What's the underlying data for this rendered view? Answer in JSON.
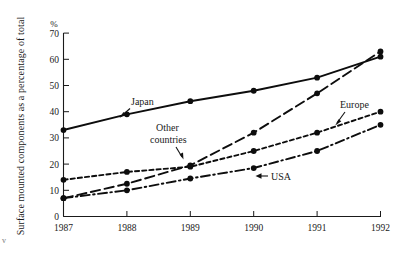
{
  "chart_data": {
    "type": "line",
    "title": "",
    "subtitle": "",
    "xlabel": "",
    "ylabel": "Surface mounted components as a percentage of total",
    "unit_label": "%",
    "categories": [
      "1987",
      "1988",
      "1989",
      "1990",
      "1991",
      "1992"
    ],
    "x": [
      1987,
      1988,
      1989,
      1990,
      1991,
      1992
    ],
    "xlim": [
      1987,
      1992
    ],
    "ylim": [
      0,
      70
    ],
    "yticks": [
      0,
      10,
      20,
      30,
      40,
      50,
      60,
      70
    ],
    "ytick_labels": [
      "0",
      "10",
      "20",
      "30",
      "40",
      "50",
      "60",
      "70"
    ],
    "xtick_labels": [
      "1987",
      "1988",
      "1989",
      "1990",
      "1991",
      "1992"
    ],
    "grid": false,
    "legend": "inline-annotations",
    "series": [
      {
        "name": "Japan",
        "style": "solid",
        "color": "#0d0d0d",
        "values": [
          33,
          39,
          44,
          48,
          53,
          61
        ]
      },
      {
        "name": "Other countries",
        "style": "long-dash",
        "color": "#0d0d0d",
        "values": [
          7,
          12.5,
          19.5,
          32,
          47,
          63
        ]
      },
      {
        "name": "Europe",
        "style": "short-dash",
        "color": "#0d0d0d",
        "values": [
          14,
          17,
          19,
          25,
          32,
          40
        ]
      },
      {
        "name": "USA",
        "style": "dash-dot",
        "color": "#0d0d0d",
        "values": [
          7,
          10,
          14.5,
          18.5,
          25,
          35
        ]
      }
    ],
    "annotations": [
      {
        "text": "Japan",
        "series": "Japan"
      },
      {
        "text_line1": "Other",
        "text_line2": "countries",
        "series": "Other countries"
      },
      {
        "text": "Europe",
        "series": "Europe"
      },
      {
        "text": "USA",
        "series": "USA"
      }
    ]
  },
  "annotations": {
    "japan": "Japan",
    "other_line1": "Other",
    "other_line2": "countries",
    "europe": "Europe",
    "usa": "USA"
  },
  "axes": {
    "y_title": "Surface mounted components as a percentage of total",
    "unit": "%",
    "y0": "0",
    "y10": "10",
    "y20": "20",
    "y30": "30",
    "y40": "40",
    "y50": "50",
    "y60": "60",
    "y70": "70",
    "x1987": "1987",
    "x1988": "1988",
    "x1989": "1989",
    "x1990": "1990",
    "x1991": "1991",
    "x1992": "1992"
  },
  "page_marks": {
    "left_edge": "v"
  },
  "colors": {
    "ink": "#0d0d0d",
    "background": "#ffffff"
  }
}
